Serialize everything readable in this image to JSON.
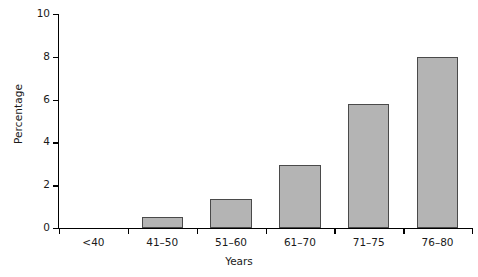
{
  "chart_data": {
    "type": "bar",
    "title": "",
    "xlabel": "Years",
    "ylabel": "Percentage",
    "categories": [
      "<40",
      "41–50",
      "51–60",
      "61–70",
      "71–75",
      "76–80"
    ],
    "values": [
      0,
      0.5,
      1.35,
      2.95,
      5.8,
      8.0
    ],
    "ylim": [
      0,
      10
    ],
    "yticks": [
      0,
      2,
      4,
      6,
      8,
      10
    ],
    "ytick_labels": [
      "0",
      "2",
      "4",
      "6",
      "8",
      "10"
    ],
    "grid": false,
    "legend": false,
    "bar_color": "#b4b4b4",
    "bar_edge_color": "#4a4a4a",
    "axis_color": "#000000",
    "background": "#ffffff"
  },
  "axes": {
    "y_title": "Percentage",
    "x_title": "Years"
  }
}
